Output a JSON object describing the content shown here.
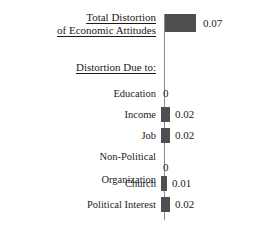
{
  "chart_data": {
    "type": "bar",
    "orientation": "horizontal",
    "title": "Total Distortion of Economic Attitudes",
    "title_lines": [
      "Total Distortion",
      "of Economic Attitudes"
    ],
    "section_header": "Distortion Due to:",
    "xlabel": "",
    "ylabel": "",
    "grid": false,
    "legend": "none",
    "xlim": [
      0,
      0.08
    ],
    "bar_color": "#4f4f4f",
    "axis_color": "#8a8a8a",
    "background_color": "#ffffff",
    "total": {
      "label": "Total Distortion of Economic Attitudes",
      "value": 0.07,
      "value_label": "0.07"
    },
    "categories": [
      "Education",
      "Income",
      "Job",
      "Non-Political Organization",
      "Church",
      "Political Interest"
    ],
    "values": [
      0,
      0.02,
      0.02,
      0,
      0.01,
      0.02
    ],
    "value_labels": [
      "0",
      "0.02",
      "0.02",
      "0",
      "0.01",
      "0.02"
    ]
  },
  "rows": [
    {
      "label_lines": [
        "Education"
      ],
      "value_label": "0",
      "bar_px": 0,
      "top_px": 76,
      "zero": true
    },
    {
      "label_lines": [
        "Income"
      ],
      "value_label": "0.02",
      "bar_px": 9,
      "top_px": 97,
      "zero": false
    },
    {
      "label_lines": [
        "Job"
      ],
      "value_label": "0.02",
      "bar_px": 9,
      "top_px": 118,
      "zero": false
    },
    {
      "label_lines": [
        "Non-Political",
        "Organization"
      ],
      "value_label": "0",
      "bar_px": 0,
      "top_px": 139,
      "zero": true
    },
    {
      "label_lines": [
        "Church"
      ],
      "value_label": "0.01",
      "bar_px": 6,
      "top_px": 166,
      "zero": false
    },
    {
      "label_lines": [
        "Political Interest"
      ],
      "value_label": "0.02",
      "bar_px": 9,
      "top_px": 187,
      "zero": false
    }
  ]
}
